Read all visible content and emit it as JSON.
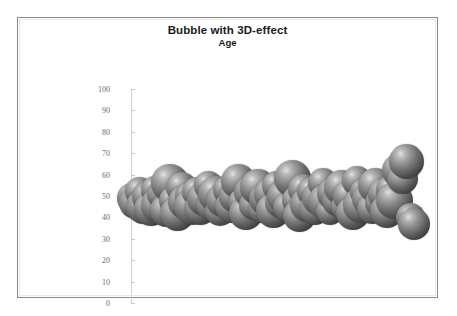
{
  "chart": {
    "title": "Bubble with 3D-effect",
    "subtitle": "Age",
    "frame_color": "#8a8a8a",
    "background": "#ffffff",
    "bubble_highlight_color": "#e3e3e3",
    "bubble_mid_color": "#777777",
    "bubble_shadow_color": "#1d1d1d",
    "axis_line_color": "#d2d2d2",
    "tick_label_color": "#6b6b6b"
  },
  "chart_data": {
    "type": "scatter",
    "title": "Bubble with 3D-effect",
    "subtitle": "Age",
    "xlabel": "",
    "ylabel": "",
    "ylim": [
      0,
      100
    ],
    "yticks": [
      0,
      10,
      20,
      30,
      40,
      50,
      60,
      70,
      80,
      90,
      100
    ],
    "ytick_labels": [
      "0",
      "10",
      "20",
      "30",
      "40",
      "50",
      "60",
      "70",
      "80",
      "90",
      "100"
    ],
    "grid": false,
    "legend": "none",
    "marker_style": "3d-sphere-gradient-grayscale",
    "series": [
      {
        "name": "Age",
        "points": [
          {
            "x": 1,
            "y": 49,
            "size": 30
          },
          {
            "x": 2,
            "y": 47,
            "size": 33
          },
          {
            "x": 3,
            "y": 52,
            "size": 29
          },
          {
            "x": 4,
            "y": 45,
            "size": 35
          },
          {
            "x": 5,
            "y": 50,
            "size": 31
          },
          {
            "x": 6,
            "y": 44,
            "size": 34
          },
          {
            "x": 7,
            "y": 53,
            "size": 28
          },
          {
            "x": 8,
            "y": 46,
            "size": 36
          },
          {
            "x": 9,
            "y": 51,
            "size": 30
          },
          {
            "x": 10,
            "y": 43,
            "size": 33
          },
          {
            "x": 11,
            "y": 56,
            "size": 38
          },
          {
            "x": 12,
            "y": 48,
            "size": 29
          },
          {
            "x": 13,
            "y": 42,
            "size": 35
          },
          {
            "x": 14,
            "y": 54,
            "size": 31
          },
          {
            "x": 15,
            "y": 47,
            "size": 34
          },
          {
            "x": 16,
            "y": 50,
            "size": 28
          },
          {
            "x": 17,
            "y": 45,
            "size": 37
          },
          {
            "x": 18,
            "y": 52,
            "size": 30
          },
          {
            "x": 19,
            "y": 44,
            "size": 33
          },
          {
            "x": 20,
            "y": 49,
            "size": 35
          },
          {
            "x": 21,
            "y": 55,
            "size": 29
          },
          {
            "x": 22,
            "y": 46,
            "size": 32
          },
          {
            "x": 23,
            "y": 51,
            "size": 36
          },
          {
            "x": 24,
            "y": 43,
            "size": 30
          },
          {
            "x": 25,
            "y": 48,
            "size": 34
          },
          {
            "x": 26,
            "y": 53,
            "size": 28
          },
          {
            "x": 27,
            "y": 45,
            "size": 33
          },
          {
            "x": 28,
            "y": 50,
            "size": 31
          },
          {
            "x": 29,
            "y": 57,
            "size": 35
          },
          {
            "x": 30,
            "y": 47,
            "size": 29
          },
          {
            "x": 31,
            "y": 42,
            "size": 34
          },
          {
            "x": 32,
            "y": 52,
            "size": 32
          },
          {
            "x": 33,
            "y": 46,
            "size": 30
          },
          {
            "x": 34,
            "y": 54,
            "size": 36
          },
          {
            "x": 35,
            "y": 44,
            "size": 28
          },
          {
            "x": 36,
            "y": 49,
            "size": 33
          },
          {
            "x": 37,
            "y": 51,
            "size": 31
          },
          {
            "x": 38,
            "y": 43,
            "size": 35
          },
          {
            "x": 39,
            "y": 55,
            "size": 29
          },
          {
            "x": 40,
            "y": 47,
            "size": 32
          },
          {
            "x": 41,
            "y": 50,
            "size": 34
          },
          {
            "x": 42,
            "y": 45,
            "size": 30
          },
          {
            "x": 43,
            "y": 58,
            "size": 37
          },
          {
            "x": 44,
            "y": 48,
            "size": 28
          },
          {
            "x": 45,
            "y": 41,
            "size": 33
          },
          {
            "x": 46,
            "y": 53,
            "size": 31
          },
          {
            "x": 47,
            "y": 46,
            "size": 35
          },
          {
            "x": 48,
            "y": 52,
            "size": 29
          },
          {
            "x": 49,
            "y": 44,
            "size": 32
          },
          {
            "x": 50,
            "y": 49,
            "size": 34
          },
          {
            "x": 51,
            "y": 56,
            "size": 30
          },
          {
            "x": 52,
            "y": 47,
            "size": 36
          },
          {
            "x": 53,
            "y": 43,
            "size": 28
          },
          {
            "x": 54,
            "y": 51,
            "size": 33
          },
          {
            "x": 55,
            "y": 48,
            "size": 31
          },
          {
            "x": 56,
            "y": 54,
            "size": 35
          },
          {
            "x": 57,
            "y": 45,
            "size": 29
          },
          {
            "x": 58,
            "y": 50,
            "size": 32
          },
          {
            "x": 59,
            "y": 42,
            "size": 34
          },
          {
            "x": 60,
            "y": 57,
            "size": 30
          },
          {
            "x": 61,
            "y": 46,
            "size": 36
          },
          {
            "x": 62,
            "y": 52,
            "size": 28
          },
          {
            "x": 63,
            "y": 49,
            "size": 33
          },
          {
            "x": 64,
            "y": 44,
            "size": 31
          },
          {
            "x": 65,
            "y": 55,
            "size": 35
          },
          {
            "x": 66,
            "y": 47,
            "size": 29
          },
          {
            "x": 67,
            "y": 51,
            "size": 32
          },
          {
            "x": 68,
            "y": 43,
            "size": 34
          },
          {
            "x": 69,
            "y": 53,
            "size": 30
          },
          {
            "x": 70,
            "y": 48,
            "size": 37
          },
          {
            "x": 71,
            "y": 62,
            "size": 33
          },
          {
            "x": 72,
            "y": 58,
            "size": 31
          },
          {
            "x": 73,
            "y": 66,
            "size": 35
          },
          {
            "x": 74,
            "y": 40,
            "size": 29
          },
          {
            "x": 75,
            "y": 37,
            "size": 32
          }
        ]
      }
    ]
  }
}
